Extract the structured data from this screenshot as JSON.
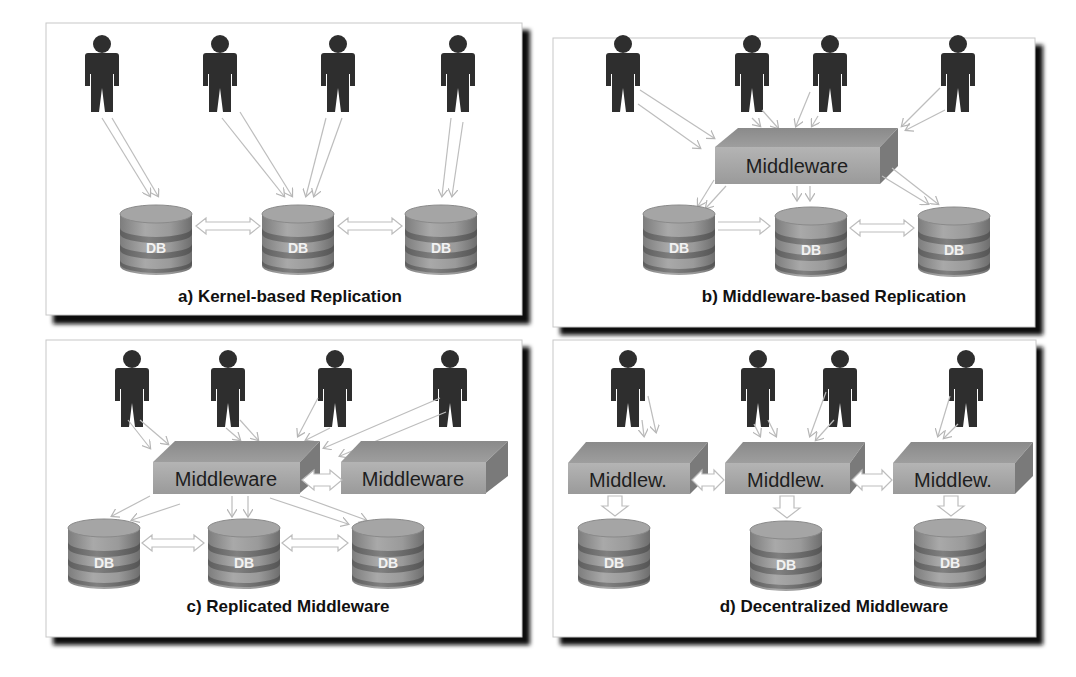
{
  "figure": {
    "panels": [
      {
        "id": "a",
        "caption": "a) Kernel-based Replication",
        "users": 4,
        "middleware": [],
        "databases": [
          "DB",
          "DB",
          "DB"
        ]
      },
      {
        "id": "b",
        "caption": "b) Middleware-based Replication",
        "users": 4,
        "middleware": [
          "Middleware"
        ],
        "databases": [
          "DB",
          "DB",
          "DB"
        ]
      },
      {
        "id": "c",
        "caption": "c) Replicated Middleware",
        "users": 4,
        "middleware": [
          "Middleware",
          "Middleware"
        ],
        "databases": [
          "DB",
          "DB",
          "DB"
        ]
      },
      {
        "id": "d",
        "caption": "d) Decentralized Middleware",
        "users": 4,
        "middleware": [
          "Middlew.",
          "Middlew.",
          "Middlew."
        ],
        "databases": [
          "DB",
          "DB",
          "DB"
        ]
      }
    ],
    "colors": {
      "panel_border": "#c8c8c8",
      "panel_shadow": "#111111",
      "user": "#2e2e2e",
      "middleware_front": "#a8a8a8",
      "middleware_top": "#8f8f8f",
      "middleware_side": "#7a7a7a",
      "db_body": "#9c9c9c",
      "db_band": "#777777",
      "arrow": "#bdbdbd"
    }
  }
}
